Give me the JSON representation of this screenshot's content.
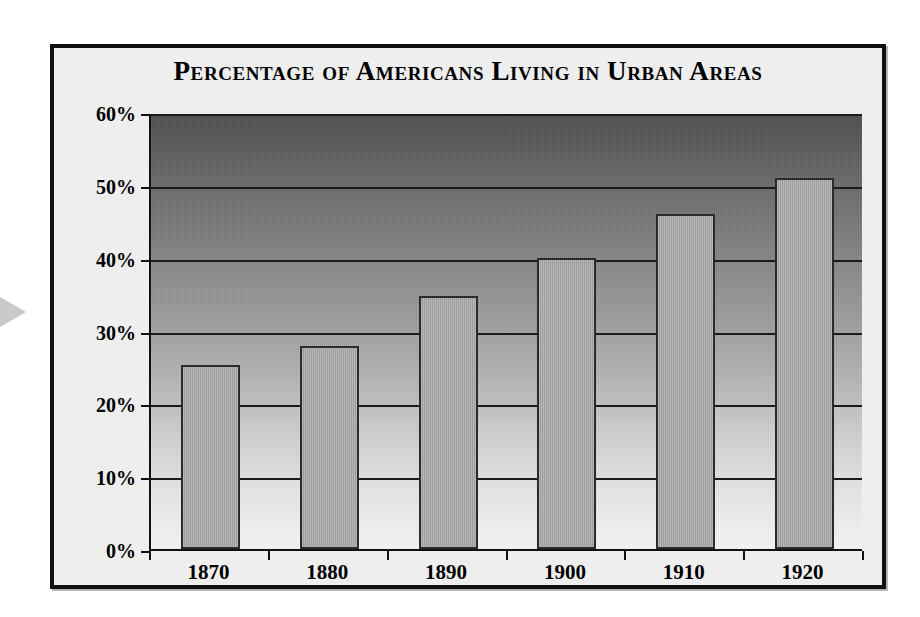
{
  "figure": {
    "title": "Percentage of Americans Living in Urban Areas",
    "frame_color": "#111111",
    "panel_background": "#eeeeee",
    "marker_icon": "play-triangle-icon"
  },
  "chart_data": {
    "type": "bar",
    "title": "Percentage of Americans Living in Urban Areas",
    "categories": [
      "1870",
      "1880",
      "1890",
      "1900",
      "1910",
      "1920"
    ],
    "values": [
      25.2,
      27.9,
      34.8,
      39.9,
      46.0,
      51.0
    ],
    "xlabel": "",
    "ylabel": "",
    "ylim": [
      0,
      60
    ],
    "ytick_values": [
      0,
      10,
      20,
      30,
      40,
      50,
      60
    ],
    "ytick_labels": [
      "0%",
      "10%",
      "20%",
      "30%",
      "40%",
      "50%",
      "60%"
    ],
    "grid": true,
    "legend": false,
    "bar_color": "#a6a6a6",
    "bar_border_color": "#2b2b2b",
    "plot_gradient_top": "#4f4f4f",
    "plot_gradient_bottom": "#f5f5f5"
  }
}
